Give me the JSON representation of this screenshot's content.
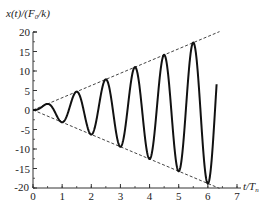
{
  "chart_data": {
    "type": "line",
    "title": "",
    "xlabel": "t/T_n",
    "ylabel": "x(t)/(F_0/k)",
    "xlim": [
      0,
      7
    ],
    "ylim": [
      -20,
      20
    ],
    "x_ticks": [
      "0",
      "1",
      "2",
      "3",
      "4",
      "5",
      "6",
      "7"
    ],
    "y_ticks": [
      "20",
      "15",
      "10",
      "5",
      "0",
      "-5",
      "-10",
      "-15",
      "-20"
    ],
    "grid": false,
    "legend": null,
    "series": [
      {
        "name": "response",
        "style": "solid",
        "formula": "0.5*(sin(2*pi*t) - 2*pi*t*cos(2*pi*t))",
        "t_range": [
          0,
          6.3
        ],
        "extrema": [
          {
            "t": 0.5,
            "value": 1.57
          },
          {
            "t": 1.0,
            "value": -3.14
          },
          {
            "t": 1.5,
            "value": 4.71
          },
          {
            "t": 2.0,
            "value": -6.28
          },
          {
            "t": 2.5,
            "value": 7.85
          },
          {
            "t": 3.0,
            "value": -9.42
          },
          {
            "t": 3.5,
            "value": 11.0
          },
          {
            "t": 4.0,
            "value": -12.57
          },
          {
            "t": 4.5,
            "value": 14.14
          },
          {
            "t": 5.0,
            "value": -15.71
          },
          {
            "t": 5.5,
            "value": 17.28
          },
          {
            "t": 6.0,
            "value": -18.85
          }
        ],
        "end_value": 12.3
      },
      {
        "name": "upper envelope",
        "style": "dashed",
        "x": [
          0,
          6.4
        ],
        "values": [
          0,
          20.1
        ]
      },
      {
        "name": "lower envelope",
        "style": "dashed",
        "x": [
          0,
          6.4
        ],
        "values": [
          0,
          -20.1
        ]
      }
    ]
  },
  "axes": {
    "y_title": "x(t)/(F",
    "y_title_sub": "0",
    "y_title_end": "/k)",
    "x_title": "t/T",
    "x_title_sub": "n"
  }
}
